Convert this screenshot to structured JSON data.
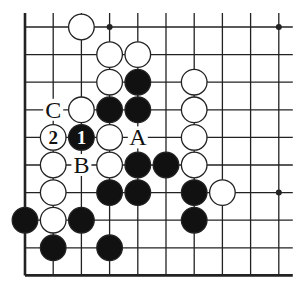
{
  "diagram": {
    "type": "go-board-fragment",
    "columns": 10,
    "rows": 10,
    "edges": [
      "left",
      "bottom"
    ],
    "grid": {
      "x0": 25,
      "y0": 27,
      "dx": 28.2,
      "dy": 27.6,
      "extend_top": 14,
      "extend_right": 14
    },
    "colors": {
      "line": "#222222",
      "black_stone": "#111111",
      "white_stone": "#ffffff",
      "stone_outline": "#222222"
    },
    "hoshi": [
      [
        3,
        0
      ],
      [
        9,
        0
      ],
      [
        9,
        6
      ]
    ],
    "stones": [
      {
        "col": 2,
        "row": 0,
        "color": "white"
      },
      {
        "col": 3,
        "row": 1,
        "color": "white"
      },
      {
        "col": 4,
        "row": 1,
        "color": "white"
      },
      {
        "col": 3,
        "row": 2,
        "color": "white"
      },
      {
        "col": 4,
        "row": 2,
        "color": "black"
      },
      {
        "col": 6,
        "row": 2,
        "color": "white"
      },
      {
        "col": 2,
        "row": 3,
        "color": "white"
      },
      {
        "col": 3,
        "row": 3,
        "color": "black"
      },
      {
        "col": 4,
        "row": 3,
        "color": "black"
      },
      {
        "col": 6,
        "row": 3,
        "color": "white"
      },
      {
        "col": 1,
        "row": 4,
        "color": "white",
        "label": "2"
      },
      {
        "col": 2,
        "row": 4,
        "color": "black",
        "label": "1"
      },
      {
        "col": 3,
        "row": 4,
        "color": "white"
      },
      {
        "col": 6,
        "row": 4,
        "color": "white"
      },
      {
        "col": 1,
        "row": 5,
        "color": "white"
      },
      {
        "col": 3,
        "row": 5,
        "color": "white"
      },
      {
        "col": 4,
        "row": 5,
        "color": "black"
      },
      {
        "col": 5,
        "row": 5,
        "color": "black"
      },
      {
        "col": 6,
        "row": 5,
        "color": "white"
      },
      {
        "col": 1,
        "row": 6,
        "color": "white"
      },
      {
        "col": 3,
        "row": 6,
        "color": "black"
      },
      {
        "col": 4,
        "row": 6,
        "color": "black"
      },
      {
        "col": 6,
        "row": 6,
        "color": "black"
      },
      {
        "col": 7,
        "row": 6,
        "color": "white"
      },
      {
        "col": 0,
        "row": 7,
        "color": "black"
      },
      {
        "col": 1,
        "row": 7,
        "color": "white"
      },
      {
        "col": 2,
        "row": 7,
        "color": "black"
      },
      {
        "col": 6,
        "row": 7,
        "color": "black"
      },
      {
        "col": 1,
        "row": 8,
        "color": "black"
      },
      {
        "col": 3,
        "row": 8,
        "color": "black"
      }
    ],
    "point_labels": [
      {
        "col": 1,
        "row": 3,
        "text": "C"
      },
      {
        "col": 4,
        "row": 4,
        "text": "A"
      },
      {
        "col": 2,
        "row": 5,
        "text": "B"
      }
    ]
  }
}
